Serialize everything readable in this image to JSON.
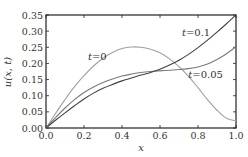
{
  "chart_data": {
    "type": "line",
    "title": "",
    "xlabel": "x",
    "ylabel": "u(x, t)",
    "xlim": [
      0.0,
      1.0
    ],
    "ylim": [
      0.0,
      0.35
    ],
    "grid": false,
    "legend": "none (inline annotations)",
    "x_ticks": [
      "0.0",
      "0.2",
      "0.4",
      "0.6",
      "0.8",
      "1.0"
    ],
    "y_ticks": [
      "0.00",
      "0.05",
      "0.10",
      "0.15",
      "0.20",
      "0.25",
      "0.30",
      "0.35"
    ],
    "x": [
      0.0,
      0.05,
      0.1,
      0.15,
      0.2,
      0.25,
      0.3,
      0.35,
      0.4,
      0.45,
      0.5,
      0.55,
      0.6,
      0.65,
      0.7,
      0.75,
      0.8,
      0.85,
      0.9,
      0.95,
      1.0
    ],
    "series": [
      {
        "name": "t=0",
        "color": "#a0a0a0",
        "values": [
          0.0,
          0.045,
          0.088,
          0.128,
          0.162,
          0.192,
          0.216,
          0.234,
          0.246,
          0.251,
          0.25,
          0.244,
          0.233,
          0.214,
          0.19,
          0.16,
          0.125,
          0.088,
          0.055,
          0.03,
          0.022
        ]
      },
      {
        "name": "t=0.05",
        "color": "#7a7a7a",
        "values": [
          0.0,
          0.032,
          0.062,
          0.088,
          0.11,
          0.127,
          0.141,
          0.152,
          0.161,
          0.167,
          0.172,
          0.175,
          0.177,
          0.179,
          0.181,
          0.184,
          0.189,
          0.198,
          0.212,
          0.23,
          0.252
        ]
      },
      {
        "name": "t=0.1",
        "color": "#404040",
        "values": [
          0.0,
          0.024,
          0.047,
          0.069,
          0.09,
          0.108,
          0.123,
          0.135,
          0.146,
          0.155,
          0.164,
          0.172,
          0.182,
          0.195,
          0.21,
          0.228,
          0.249,
          0.272,
          0.297,
          0.323,
          0.35
        ]
      }
    ],
    "annotations": [
      {
        "text": "t=0",
        "x": 0.27,
        "y": 0.21
      },
      {
        "text": "t=0.1",
        "x": 0.79,
        "y": 0.285
      },
      {
        "text": "t=0.05",
        "x": 0.84,
        "y": 0.155
      }
    ]
  },
  "labels": {
    "xlabel": "x",
    "ylabel": "u(x, t)",
    "annot_t0": "t=0",
    "annot_t01": "t=0.1",
    "annot_t005": "t=0.05"
  }
}
